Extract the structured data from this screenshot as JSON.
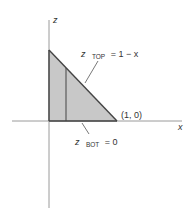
{
  "diagram": {
    "axes": {
      "x_label": "x",
      "z_label": "z"
    },
    "region": {
      "fill_color": "#c8c8c8",
      "edge_color": "#444444",
      "vertices": [
        [
          0,
          0
        ],
        [
          0,
          1
        ],
        [
          1,
          0
        ]
      ]
    },
    "annotations": {
      "top_var": "z",
      "top_sub": "TOP",
      "top_rhs": "= 1 − x",
      "bot_var": "z",
      "bot_sub": "BOT",
      "bot_rhs": "= 0",
      "point_label": "(1, 0)"
    },
    "colors": {
      "axis": "#9a9a9a",
      "fill": "#c8c8c8",
      "edge": "#444444",
      "text": "#333333"
    }
  }
}
